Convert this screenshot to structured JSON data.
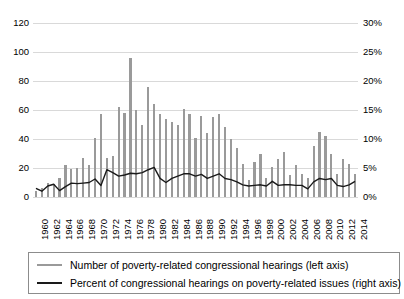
{
  "chart_data": {
    "type": "bar",
    "title": "",
    "xlabel": "",
    "ylabel": "",
    "grid": true,
    "legend_position": "bottom",
    "x": [
      1960,
      1961,
      1962,
      1963,
      1964,
      1965,
      1966,
      1967,
      1968,
      1969,
      1970,
      1971,
      1972,
      1973,
      1974,
      1975,
      1976,
      1977,
      1978,
      1979,
      1980,
      1981,
      1982,
      1983,
      1984,
      1985,
      1986,
      1987,
      1988,
      1989,
      1990,
      1991,
      1992,
      1993,
      1994,
      1995,
      1996,
      1997,
      1998,
      1999,
      2000,
      2001,
      2002,
      2003,
      2004,
      2005,
      2006,
      2007,
      2008,
      2009,
      2010,
      2011,
      2012,
      2013,
      2014
    ],
    "categories": [
      "1960",
      "1961",
      "1962",
      "1963",
      "1964",
      "1965",
      "1966",
      "1967",
      "1968",
      "1969",
      "1970",
      "1971",
      "1972",
      "1973",
      "1974",
      "1975",
      "1976",
      "1977",
      "1978",
      "1979",
      "1980",
      "1981",
      "1982",
      "1983",
      "1984",
      "1985",
      "1986",
      "1987",
      "1988",
      "1989",
      "1990",
      "1991",
      "1992",
      "1993",
      "1994",
      "1995",
      "1996",
      "1997",
      "1998",
      "1999",
      "2000",
      "2001",
      "2002",
      "2003",
      "2004",
      "2005",
      "2006",
      "2007",
      "2008",
      "2009",
      "2010",
      "2011",
      "2012",
      "2013",
      "2014"
    ],
    "xtick_labels": [
      "1960",
      "1962",
      "1964",
      "1966",
      "1968",
      "1970",
      "1972",
      "1974",
      "1976",
      "1978",
      "1980",
      "1982",
      "1984",
      "1986",
      "1988",
      "1990",
      "1992",
      "1994",
      "1996",
      "1998",
      "2000",
      "2002",
      "2004",
      "2006",
      "2008",
      "2010",
      "2012",
      "2014"
    ],
    "left_axis": {
      "ticks": [
        "0",
        "20",
        "40",
        "60",
        "80",
        "100",
        "120"
      ],
      "ylim": [
        0,
        120
      ]
    },
    "right_axis": {
      "ticks": [
        "0%",
        "5%",
        "10%",
        "15%",
        "20%",
        "25%",
        "30%"
      ],
      "ylim": [
        0,
        30
      ]
    },
    "series": [
      {
        "name": "Number of poverty-related congressional hearings (left axis)",
        "type": "bar",
        "axis": "left",
        "color": "#9a9a9a",
        "values": [
          4,
          6,
          10,
          9,
          13,
          22,
          19,
          20,
          27,
          22,
          41,
          57,
          27,
          28,
          62,
          58,
          96,
          60,
          50,
          76,
          64,
          57,
          54,
          52,
          50,
          61,
          57,
          41,
          56,
          44,
          55,
          57,
          48,
          40,
          34,
          23,
          12,
          24,
          30,
          13,
          21,
          26,
          31,
          15,
          22,
          16,
          13,
          35,
          45,
          42,
          30,
          16,
          26,
          23,
          16
        ]
      },
      {
        "name": "Percent of congressional hearings on poverty-related issues (right axis)",
        "type": "line",
        "axis": "right",
        "color": "#1a1a1a",
        "values": [
          1.5,
          1.0,
          1.9,
          2.2,
          1.1,
          1.8,
          2.4,
          2.3,
          2.4,
          2.5,
          3.1,
          2.0,
          4.7,
          4.2,
          3.6,
          3.8,
          4.1,
          4.0,
          4.2,
          4.7,
          5.1,
          3.2,
          2.5,
          3.2,
          3.6,
          4.0,
          4.0,
          3.6,
          3.9,
          3.2,
          3.6,
          4.0,
          3.2,
          3.0,
          2.6,
          2.1,
          1.9,
          2.0,
          2.1,
          1.9,
          2.7,
          2.0,
          2.1,
          2.1,
          2.0,
          2.0,
          1.4,
          2.6,
          3.2,
          3.0,
          3.2,
          2.0,
          1.8,
          2.1,
          2.7
        ]
      }
    ]
  },
  "legend": {
    "items": [
      {
        "label": "Number of poverty-related congressional hearings (left axis)",
        "marker": "bar-swatch"
      },
      {
        "label": "Percent of congressional hearings on poverty-related issues (right axis)",
        "marker": "line-swatch"
      }
    ]
  }
}
